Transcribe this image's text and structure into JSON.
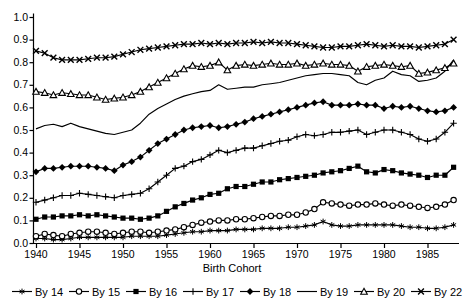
{
  "chart_data": {
    "type": "line",
    "title": "",
    "xlabel": "Birth Cohort",
    "ylabel": "",
    "grid": false,
    "legend_position": "bottom",
    "xlim": [
      1939.6,
      1989
    ],
    "ylim": [
      0.0,
      1.0
    ],
    "x_tick_labels": [
      "1940",
      "1945",
      "1950",
      "1955",
      "1960",
      "1965",
      "1970",
      "1975",
      "1980",
      "1985"
    ],
    "x_tick_values": [
      1940,
      1945,
      1950,
      1955,
      1960,
      1965,
      1970,
      1975,
      1980,
      1985
    ],
    "y_tick_labels": [
      "0.0",
      "0.1",
      "0.2",
      "0.3",
      "0.4",
      "0.5",
      "0.6",
      "0.7",
      "0.8",
      "0.9",
      "1.0"
    ],
    "y_tick_values": [
      0.0,
      0.1,
      0.2,
      0.3,
      0.4,
      0.5,
      0.6,
      0.7,
      0.8,
      0.9,
      1.0
    ],
    "colors": {
      "series": "#000000",
      "background": "#ffffff",
      "text": "#000000"
    },
    "x": [
      1940,
      1941,
      1942,
      1943,
      1944,
      1945,
      1946,
      1947,
      1948,
      1949,
      1950,
      1951,
      1952,
      1953,
      1954,
      1955,
      1956,
      1957,
      1958,
      1959,
      1960,
      1961,
      1962,
      1963,
      1964,
      1965,
      1966,
      1967,
      1968,
      1969,
      1970,
      1971,
      1972,
      1973,
      1974,
      1975,
      1976,
      1977,
      1978,
      1979,
      1980,
      1981,
      1982,
      1983,
      1984,
      1985,
      1986,
      1987,
      1988
    ],
    "series": [
      {
        "name": "By 14",
        "marker": "asterisk",
        "values": [
          0.02,
          0.02,
          0.015,
          0.015,
          0.02,
          0.025,
          0.025,
          0.025,
          0.025,
          0.025,
          0.025,
          0.03,
          0.03,
          0.03,
          0.03,
          0.035,
          0.04,
          0.045,
          0.05,
          0.05,
          0.055,
          0.055,
          0.055,
          0.06,
          0.06,
          0.06,
          0.065,
          0.065,
          0.065,
          0.07,
          0.07,
          0.075,
          0.08,
          0.095,
          0.08,
          0.075,
          0.075,
          0.08,
          0.08,
          0.08,
          0.08,
          0.08,
          0.075,
          0.07,
          0.07,
          0.065,
          0.065,
          0.07,
          0.08
        ]
      },
      {
        "name": "By 15",
        "marker": "circle-open",
        "values": [
          0.03,
          0.04,
          0.035,
          0.03,
          0.04,
          0.045,
          0.05,
          0.05,
          0.045,
          0.04,
          0.045,
          0.05,
          0.05,
          0.045,
          0.05,
          0.055,
          0.06,
          0.07,
          0.08,
          0.09,
          0.095,
          0.1,
          0.1,
          0.105,
          0.105,
          0.11,
          0.115,
          0.12,
          0.12,
          0.125,
          0.125,
          0.135,
          0.15,
          0.18,
          0.175,
          0.17,
          0.165,
          0.17,
          0.17,
          0.175,
          0.17,
          0.165,
          0.17,
          0.165,
          0.16,
          0.155,
          0.16,
          0.17,
          0.19
        ]
      },
      {
        "name": "By 16",
        "marker": "square-filled",
        "values": [
          0.105,
          0.115,
          0.115,
          0.12,
          0.12,
          0.125,
          0.12,
          0.125,
          0.12,
          0.115,
          0.11,
          0.11,
          0.105,
          0.11,
          0.12,
          0.14,
          0.16,
          0.175,
          0.19,
          0.2,
          0.215,
          0.22,
          0.24,
          0.25,
          0.25,
          0.26,
          0.27,
          0.27,
          0.28,
          0.285,
          0.29,
          0.295,
          0.3,
          0.31,
          0.315,
          0.32,
          0.33,
          0.34,
          0.315,
          0.31,
          0.325,
          0.32,
          0.31,
          0.305,
          0.3,
          0.29,
          0.3,
          0.3,
          0.335
        ]
      },
      {
        "name": "By 17",
        "marker": "plus",
        "values": [
          0.18,
          0.19,
          0.2,
          0.21,
          0.21,
          0.22,
          0.215,
          0.21,
          0.205,
          0.2,
          0.21,
          0.215,
          0.22,
          0.24,
          0.27,
          0.3,
          0.33,
          0.34,
          0.36,
          0.37,
          0.39,
          0.41,
          0.4,
          0.41,
          0.42,
          0.42,
          0.43,
          0.44,
          0.45,
          0.455,
          0.47,
          0.48,
          0.475,
          0.48,
          0.49,
          0.49,
          0.495,
          0.5,
          0.48,
          0.49,
          0.5,
          0.5,
          0.49,
          0.48,
          0.46,
          0.45,
          0.46,
          0.49,
          0.53
        ]
      },
      {
        "name": "By 18",
        "marker": "diamond-filled",
        "values": [
          0.315,
          0.33,
          0.33,
          0.335,
          0.34,
          0.34,
          0.34,
          0.335,
          0.33,
          0.32,
          0.345,
          0.36,
          0.38,
          0.41,
          0.44,
          0.46,
          0.48,
          0.5,
          0.51,
          0.515,
          0.52,
          0.51,
          0.515,
          0.525,
          0.535,
          0.55,
          0.56,
          0.57,
          0.58,
          0.59,
          0.6,
          0.61,
          0.62,
          0.625,
          0.61,
          0.61,
          0.61,
          0.615,
          0.61,
          0.61,
          0.595,
          0.605,
          0.6,
          0.605,
          0.595,
          0.585,
          0.58,
          0.585,
          0.6
        ]
      },
      {
        "name": "By 19",
        "marker": "none",
        "values": [
          0.505,
          0.52,
          0.525,
          0.515,
          0.53,
          0.515,
          0.505,
          0.495,
          0.485,
          0.48,
          0.49,
          0.5,
          0.53,
          0.57,
          0.595,
          0.615,
          0.635,
          0.65,
          0.66,
          0.67,
          0.675,
          0.7,
          0.68,
          0.685,
          0.69,
          0.69,
          0.7,
          0.705,
          0.71,
          0.72,
          0.73,
          0.74,
          0.745,
          0.75,
          0.75,
          0.745,
          0.74,
          0.71,
          0.7,
          0.72,
          0.73,
          0.76,
          0.745,
          0.74,
          0.715,
          0.72,
          0.73,
          0.76,
          0.81
        ]
      },
      {
        "name": "By 20",
        "marker": "triangle-open",
        "values": [
          0.67,
          0.665,
          0.655,
          0.665,
          0.66,
          0.655,
          0.655,
          0.645,
          0.635,
          0.64,
          0.645,
          0.655,
          0.67,
          0.69,
          0.71,
          0.73,
          0.75,
          0.77,
          0.785,
          0.78,
          0.785,
          0.8,
          0.765,
          0.785,
          0.79,
          0.785,
          0.79,
          0.795,
          0.79,
          0.79,
          0.795,
          0.785,
          0.79,
          0.795,
          0.79,
          0.79,
          0.785,
          0.76,
          0.78,
          0.785,
          0.79,
          0.785,
          0.78,
          0.785,
          0.75,
          0.755,
          0.765,
          0.775,
          0.795
        ]
      },
      {
        "name": "By 22",
        "marker": "x",
        "values": [
          0.85,
          0.84,
          0.82,
          0.81,
          0.81,
          0.81,
          0.815,
          0.82,
          0.82,
          0.825,
          0.835,
          0.845,
          0.855,
          0.86,
          0.865,
          0.87,
          0.875,
          0.88,
          0.88,
          0.885,
          0.88,
          0.885,
          0.88,
          0.885,
          0.885,
          0.89,
          0.885,
          0.89,
          0.885,
          0.885,
          0.88,
          0.875,
          0.87,
          0.865,
          0.865,
          0.87,
          0.87,
          0.875,
          0.88,
          0.875,
          0.87,
          0.875,
          0.87,
          0.87,
          0.865,
          0.87,
          0.875,
          0.88,
          0.9
        ]
      }
    ],
    "legend": [
      "By 14",
      "By 15",
      "By 16",
      "By 17",
      "By 18",
      "By 19",
      "By 20",
      "By 22"
    ]
  }
}
